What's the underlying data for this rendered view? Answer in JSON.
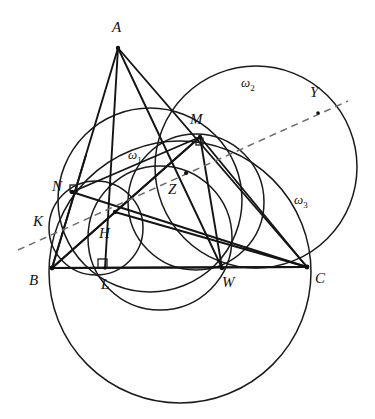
{
  "figure": {
    "width": 375,
    "height": 419,
    "background_color": "#ffffff",
    "line_color": "#141414",
    "curve_color": "#1a1a1a",
    "dashed_color": "#6b6b6b"
  },
  "points": [
    {
      "id": "A",
      "label": "A",
      "x": 118,
      "y": 48,
      "label_x": 112,
      "label_y": 20
    },
    {
      "id": "B",
      "label": "B",
      "x": 52,
      "y": 268,
      "label_x": 29,
      "label_y": 273
    },
    {
      "id": "C",
      "label": "C",
      "x": 307,
      "y": 267,
      "label_x": 315,
      "label_y": 271
    },
    {
      "id": "L",
      "label": "L",
      "x": 105,
      "y": 268,
      "label_x": 101,
      "label_y": 277
    },
    {
      "id": "H",
      "label": "H",
      "x": 115,
      "y": 212,
      "label_x": 99,
      "label_y": 226
    },
    {
      "id": "N",
      "label": "N",
      "x": 72,
      "y": 192,
      "label_x": 52,
      "label_y": 179
    },
    {
      "id": "K",
      "label": "K",
      "x": 57,
      "y": 221,
      "label_x": 33,
      "label_y": 214
    },
    {
      "id": "M",
      "label": "M",
      "x": 200,
      "y": 137,
      "label_x": 190,
      "label_y": 112
    },
    {
      "id": "Z",
      "label": "Z",
      "x": 186,
      "y": 173,
      "label_x": 168,
      "label_y": 182
    },
    {
      "id": "W",
      "label": "W",
      "x": 222,
      "y": 268,
      "label_x": 222,
      "label_y": 275
    },
    {
      "id": "Y",
      "label": "Y",
      "x": 318,
      "y": 113,
      "label_x": 310,
      "label_y": 85
    }
  ],
  "circle_labels": [
    {
      "id": "omega1",
      "base": "ω",
      "sub": "1",
      "label_x": 128,
      "label_y": 148
    },
    {
      "id": "omega2",
      "base": "ω",
      "sub": "2",
      "label_x": 241,
      "label_y": 76
    },
    {
      "id": "omega3",
      "base": "ω",
      "sub": "3",
      "label_x": 294,
      "label_y": 193
    }
  ],
  "segments": [
    {
      "id": "AB",
      "from": "A",
      "to": "B"
    },
    {
      "id": "AL",
      "from": "A",
      "to": "L"
    },
    {
      "id": "AW",
      "from": "A",
      "to": "W"
    },
    {
      "id": "AC",
      "from": "A",
      "to": "C"
    },
    {
      "id": "BC",
      "from": "B",
      "to": "C"
    },
    {
      "id": "BM",
      "from": "B",
      "to": "M"
    },
    {
      "id": "BZ_C",
      "from": "B",
      "to": "C_via_Z"
    },
    {
      "id": "NC",
      "from": "N",
      "to": "C"
    },
    {
      "id": "NM",
      "from": "N",
      "to": "M"
    },
    {
      "id": "MC",
      "from": "M",
      "to": "C"
    },
    {
      "id": "MW",
      "from": "M",
      "to": "W"
    },
    {
      "id": "HB",
      "from": "H",
      "to": "B"
    },
    {
      "id": "HC",
      "from": "H",
      "to": "C"
    }
  ],
  "circles": [
    {
      "id": "omega1",
      "cx": 150,
      "cy": 200,
      "r": 92,
      "note": "circle through N, M, W region"
    },
    {
      "id": "omega2",
      "cx": 256,
      "cy": 167,
      "r": 101,
      "note": "circle through M, C, Y"
    },
    {
      "id": "omega3",
      "cx": 180,
      "cy": 272,
      "r": 131,
      "note": "large circle through B and C"
    },
    {
      "id": "nine-point",
      "cx": 96,
      "cy": 228,
      "r": 47,
      "note": "small circle through B, N, H, L"
    },
    {
      "id": "mid-circle",
      "cx": 160,
      "cy": 238,
      "r": 72,
      "note": "circle through N, Z, W"
    },
    {
      "id": "mz-circle",
      "cx": 196,
      "cy": 202,
      "r": 68,
      "note": "circle through M, Z, W"
    }
  ],
  "dashed_line": {
    "id": "radical-axis",
    "x1": 18,
    "y1": 250,
    "x2": 348,
    "y2": 101,
    "passes_through": [
      "K",
      "H",
      "Z",
      "Y"
    ]
  },
  "right_angles": [
    {
      "id": "right-angle-at-L",
      "x": 100,
      "y": 258,
      "size": 9,
      "note": "AL perpendicular to BC"
    },
    {
      "id": "right-angle-at-M",
      "x": 196,
      "y": 139,
      "size": 7,
      "note": "right angle mark at M"
    },
    {
      "id": "right-angle-at-N",
      "x": 69,
      "y": 186,
      "size": 7,
      "note": "right angle mark at N"
    }
  ]
}
